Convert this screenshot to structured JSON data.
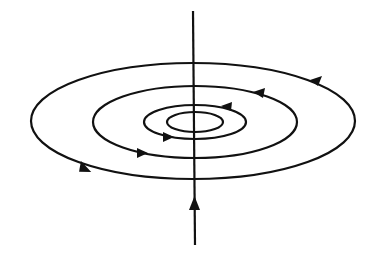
{
  "diagram": {
    "background": "#ffffff",
    "stroke_color": "#111111",
    "wire": {
      "x": 194,
      "y_top": 11,
      "y_bottom": 245,
      "current_direction": "up",
      "arrow_y": 203
    },
    "field_lines": [
      {
        "name": "outer",
        "cx": 193,
        "cy": 121,
        "rx": 162,
        "ry": 58,
        "direction": "counterclockwise-viewed-from-above"
      },
      {
        "name": "second",
        "cx": 195,
        "cy": 122,
        "rx": 102,
        "ry": 36,
        "direction": "counterclockwise-viewed-from-above"
      },
      {
        "name": "third",
        "cx": 195,
        "cy": 122,
        "rx": 51,
        "ry": 17,
        "direction": "counterclockwise-viewed-from-above"
      },
      {
        "name": "innermost",
        "cx": 195,
        "cy": 122,
        "rx": 28,
        "ry": 10,
        "direction": "none-shown"
      }
    ]
  }
}
